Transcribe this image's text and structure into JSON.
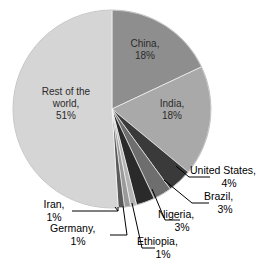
{
  "chart_data": {
    "type": "pie",
    "title": "",
    "subtitle": "",
    "xlabel": "",
    "ylabel": "",
    "legend_position": "none",
    "grid": false,
    "units": "%",
    "start_angle_deg": 0,
    "direction": "clockwise",
    "categories": [
      "China",
      "India",
      "United States",
      "Brazil",
      "Nigeria",
      "Ethiopia",
      "Germany",
      "Iran",
      "Rest of the world"
    ],
    "values": [
      18,
      18,
      4,
      3,
      3,
      1,
      1,
      1,
      51
    ],
    "colors": [
      "#8e8e8e",
      "#a9a9a9",
      "#3a3a3a",
      "#6e6e6e",
      "#2a2a2a",
      "#b3b3b3",
      "#9a9a9a",
      "#5a5a5a",
      "#d5d5d5"
    ],
    "slices": [
      {
        "label": "China",
        "value": 18,
        "value_text": "18%",
        "color": "#8e8e8e",
        "label_style": "inside"
      },
      {
        "label": "India",
        "value": 18,
        "value_text": "18%",
        "color": "#a9a9a9",
        "label_style": "inside"
      },
      {
        "label": "United States",
        "value": 4,
        "value_text": "4%",
        "color": "#3a3a3a",
        "label_style": "callout"
      },
      {
        "label": "Brazil",
        "value": 3,
        "value_text": "3%",
        "color": "#6e6e6e",
        "label_style": "callout"
      },
      {
        "label": "Nigeria",
        "value": 3,
        "value_text": "3%",
        "color": "#2a2a2a",
        "label_style": "callout"
      },
      {
        "label": "Ethiopia",
        "value": 1,
        "value_text": "1%",
        "color": "#b3b3b3",
        "label_style": "callout"
      },
      {
        "label": "Germany",
        "value": 1,
        "value_text": "1%",
        "color": "#9a9a9a",
        "label_style": "callout"
      },
      {
        "label": "Iran",
        "value": 1,
        "value_text": "1%",
        "color": "#5a5a5a",
        "label_style": "callout"
      },
      {
        "label": "Rest of the world",
        "value": 51,
        "value_text": "51%",
        "color": "#d5d5d5",
        "label_style": "inside"
      }
    ]
  },
  "labels": {
    "china": {
      "name": "China,",
      "pct": "18%"
    },
    "india": {
      "name": "India,",
      "pct": "18%"
    },
    "rest": {
      "name_line1": "Rest of the",
      "name_line2": "world,",
      "pct": "51%"
    },
    "us": {
      "name": "United States,",
      "pct": "4%"
    },
    "brazil": {
      "name": "Brazil,",
      "pct": "3%"
    },
    "nigeria": {
      "name": "Nigeria,",
      "pct": "3%"
    },
    "ethiopia": {
      "name": "Ethiopia,",
      "pct": "1%"
    },
    "germany": {
      "name": "Germany,",
      "pct": "1%"
    },
    "iran": {
      "name": "Iran,",
      "pct": "1%"
    }
  },
  "style": {
    "background": "#ffffff",
    "leader_line_color": "#000000",
    "text_color": "#000000"
  }
}
